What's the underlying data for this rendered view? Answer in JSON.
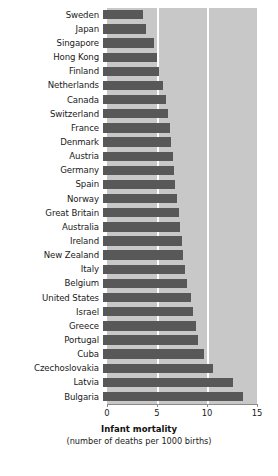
{
  "chart_data": {
    "type": "bar",
    "orientation": "horizontal",
    "title": "",
    "xlabel": "Infant mortality",
    "xlabel_sub": "(number of deaths per 1000 births)",
    "ylabel": "",
    "xlim": [
      0,
      15
    ],
    "xticks": [
      0,
      5,
      10,
      15
    ],
    "xtick_labels": [
      "0",
      "5",
      "10",
      "15"
    ],
    "grid": "vertical white gridlines at 5 and 10",
    "legend": "none",
    "bar_color": "#585858",
    "plot_background": "#c8c8c8",
    "categories": [
      "Sweden",
      "Japan",
      "Singapore",
      "Hong Kong",
      "Finland",
      "Netherlands",
      "Canada",
      "Switzerland",
      "France",
      "Denmark",
      "Austria",
      "Germany",
      "Spain",
      "Norway",
      "Great Britain",
      "Australia",
      "Ireland",
      "New Zealand",
      "Italy",
      "Belgium",
      "United States",
      "Israel",
      "Greece",
      "Portugal",
      "Cuba",
      "Czechoslovakia",
      "Latvia",
      "Bulgaria"
    ],
    "values": [
      4.0,
      4.3,
      5.1,
      5.4,
      5.6,
      6.0,
      6.3,
      6.5,
      6.7,
      6.8,
      7.0,
      7.1,
      7.2,
      7.4,
      7.6,
      7.7,
      7.9,
      8.0,
      8.2,
      8.4,
      8.8,
      9.0,
      9.3,
      9.5,
      10.1,
      11.0,
      13.0,
      14.0
    ]
  }
}
